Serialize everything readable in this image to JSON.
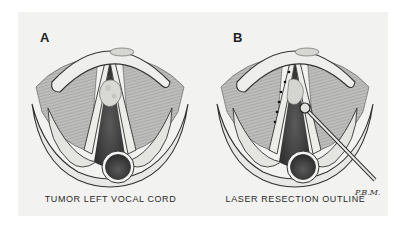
{
  "figure": {
    "panels": [
      {
        "letter": "A",
        "caption": "TUMOR LEFT VOCAL CORD",
        "illustration": "larynx-with-tumor"
      },
      {
        "letter": "B",
        "caption": "LASER RESECTION OUTLINE",
        "illustration": "larynx-with-laser-instrument-and-dotted-resection-line"
      }
    ],
    "signature": "P.B.M."
  },
  "colors": {
    "background": "#ffffff",
    "plate": "#f2f2f0",
    "ink": "#222222",
    "shade": "#8a8a8a",
    "dark": "#3a3a3a"
  }
}
